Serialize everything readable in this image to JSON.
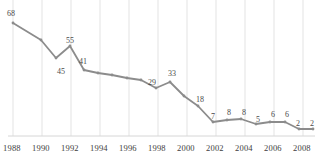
{
  "chart_data": {
    "type": "line",
    "title": "",
    "subtitle": "",
    "xlabel": "",
    "ylabel": "",
    "grid": "vertical",
    "legend": "none",
    "xlim": [
      1988,
      2009
    ],
    "ylim": [
      0,
      72
    ],
    "x": [
      1988,
      1989,
      1990,
      1991,
      1992,
      1993,
      1994,
      1995,
      1996,
      1997,
      1998,
      1999,
      2000,
      2001,
      2002,
      2003,
      2004,
      2005,
      2006,
      2007,
      2008,
      2009
    ],
    "values": [
      68,
      60,
      45,
      55,
      41,
      39,
      37,
      35,
      33,
      29,
      33,
      26,
      18,
      7,
      8,
      8,
      5,
      6,
      6,
      2,
      2,
      2
    ],
    "labeled_points": [
      {
        "x": 1988,
        "value": 68,
        "label": "68",
        "lx": 7,
        "ly": 10
      },
      {
        "x": 1990,
        "value": 45,
        "label": "45",
        "lx": 57,
        "ly": 68
      },
      {
        "x": 1991,
        "value": 55,
        "label": "55",
        "lx": 66,
        "ly": 37
      },
      {
        "x": 1992,
        "value": 41,
        "label": "41",
        "lx": 79,
        "ly": 58
      },
      {
        "x": 1997,
        "value": 29,
        "label": "29",
        "lx": 148,
        "ly": 79
      },
      {
        "x": 1998,
        "value": 33,
        "label": "33",
        "lx": 168,
        "ly": 70
      },
      {
        "x": 2000,
        "value": 18,
        "label": "18",
        "lx": 196,
        "ly": 96
      },
      {
        "x": 2001,
        "value": 7,
        "label": "7",
        "lx": 211,
        "ly": 113
      },
      {
        "x": 2002,
        "value": 8,
        "label": "8",
        "lx": 227,
        "ly": 109
      },
      {
        "x": 2003,
        "value": 8,
        "label": "8",
        "lx": 242,
        "ly": 109
      },
      {
        "x": 2004,
        "value": 5,
        "label": "5",
        "lx": 256,
        "ly": 116
      },
      {
        "x": 2005,
        "value": 6,
        "label": "6",
        "lx": 271,
        "ly": 111
      },
      {
        "x": 2006,
        "value": 6,
        "label": "6",
        "lx": 285,
        "ly": 111
      },
      {
        "x": 2007,
        "value": 2,
        "label": "2",
        "lx": 296,
        "ly": 120
      },
      {
        "x": 2008,
        "value": 2,
        "label": "2",
        "lx": 310,
        "ly": 120
      }
    ],
    "tick_labels": [
      {
        "text": "1988",
        "x": 3
      },
      {
        "text": "1990",
        "x": 32
      },
      {
        "text": "1992",
        "x": 61
      },
      {
        "text": "1994",
        "x": 90
      },
      {
        "text": "1996",
        "x": 119
      },
      {
        "text": "1998",
        "x": 148
      },
      {
        "text": "2000",
        "x": 177
      },
      {
        "text": "2002",
        "x": 206
      },
      {
        "text": "2004",
        "x": 235
      },
      {
        "text": "2006",
        "x": 264
      },
      {
        "text": "2008",
        "x": 293
      }
    ],
    "gridline_x": [
      13,
      42,
      71,
      100,
      129,
      158,
      187,
      216,
      245,
      274,
      303
    ],
    "series_points": [
      {
        "x": 13,
        "y": 23
      },
      {
        "x": 41,
        "y": 40
      },
      {
        "x": 56,
        "y": 58
      },
      {
        "x": 70,
        "y": 46
      },
      {
        "x": 84,
        "y": 70
      },
      {
        "x": 98,
        "y": 73
      },
      {
        "x": 112,
        "y": 75
      },
      {
        "x": 127,
        "y": 78
      },
      {
        "x": 141,
        "y": 80
      },
      {
        "x": 156,
        "y": 88
      },
      {
        "x": 170,
        "y": 82
      },
      {
        "x": 184,
        "y": 96
      },
      {
        "x": 198,
        "y": 106
      },
      {
        "x": 213,
        "y": 122
      },
      {
        "x": 227,
        "y": 120
      },
      {
        "x": 241,
        "y": 119
      },
      {
        "x": 256,
        "y": 124
      },
      {
        "x": 270,
        "y": 122
      },
      {
        "x": 285,
        "y": 122
      },
      {
        "x": 299,
        "y": 129
      },
      {
        "x": 313,
        "y": 129
      }
    ],
    "colors": {
      "line": "#8c8c8c",
      "marker": "#8c8c8c",
      "gridline": "#e3e3e3",
      "axis": "#d6d6d6",
      "label_text": "#4a4a4a",
      "tick_text": "#3d3d3d",
      "background": "#ffffff"
    },
    "axis_baseline_y": 136
  }
}
